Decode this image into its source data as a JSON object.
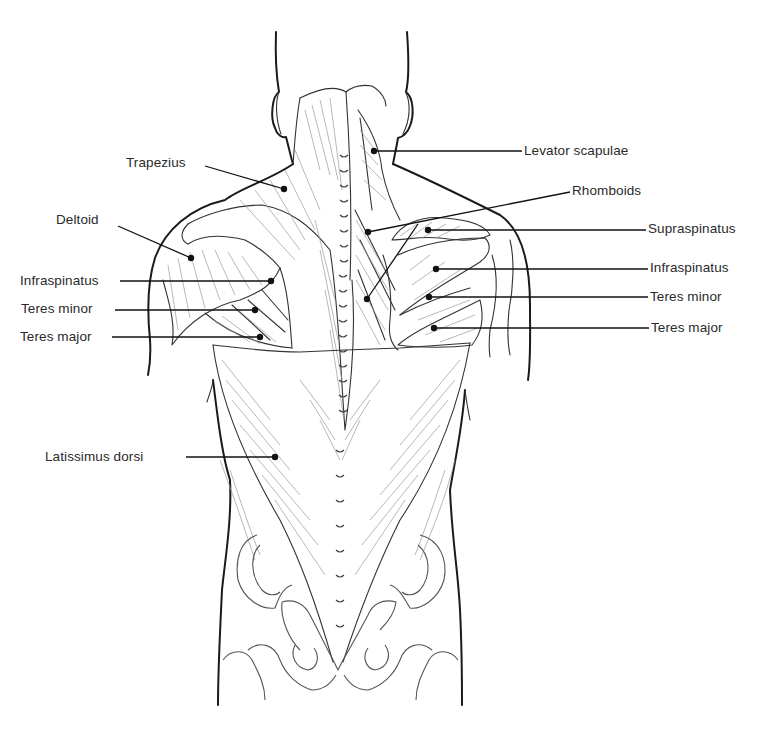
{
  "figure": {
    "view": "posterior torso"
  },
  "labels": {
    "left": [
      {
        "id": "trapezius",
        "text": "Trapezius",
        "x": 126,
        "y": 155,
        "point": [
          284,
          189
        ]
      },
      {
        "id": "deltoid",
        "text": "Deltoid",
        "x": 56,
        "y": 212,
        "point": [
          191,
          258
        ]
      },
      {
        "id": "infraspinatus-left",
        "text": "Infraspinatus",
        "x": 20,
        "y": 273,
        "point": [
          271,
          281
        ]
      },
      {
        "id": "teres-minor-left",
        "text": "Teres minor",
        "x": 21,
        "y": 301,
        "point": [
          255,
          310
        ]
      },
      {
        "id": "teres-major-left",
        "text": "Teres major",
        "x": 20,
        "y": 329,
        "point": [
          260,
          337
        ]
      },
      {
        "id": "latissimus-dorsi",
        "text": "Latissimus dorsi",
        "x": 45,
        "y": 452,
        "point": [
          275,
          457
        ]
      }
    ],
    "right": [
      {
        "id": "levator-scapulae",
        "text": "Levator scapulae",
        "x": 524,
        "y": 145,
        "point": [
          374,
          151
        ]
      },
      {
        "id": "rhomboids",
        "text": "Rhomboids",
        "x": 572,
        "y": 185,
        "point": [
          368,
          232
        ]
      },
      {
        "id": "supraspinatus",
        "text": "Supraspinatus",
        "x": 648,
        "y": 220,
        "point": [
          428,
          230
        ]
      },
      {
        "id": "infraspinatus-right",
        "text": "Infraspinatus",
        "x": 650,
        "y": 259,
        "point": [
          436,
          269
        ]
      },
      {
        "id": "teres-minor-right",
        "text": "Teres minor",
        "x": 650,
        "y": 289,
        "point": [
          429,
          297
        ]
      },
      {
        "id": "teres-major-right",
        "text": "Teres major",
        "x": 651,
        "y": 320,
        "point": [
          434,
          328
        ]
      }
    ],
    "extra_points": [
      {
        "id": "rhomboids-lower",
        "point": [
          367,
          299
        ],
        "to": [
          418,
          224
        ]
      }
    ]
  },
  "colors": {
    "background": "#ffffff",
    "outline": "#1a1a1a",
    "text": "#2a2a2a",
    "hatching": "#9a9a9a"
  }
}
